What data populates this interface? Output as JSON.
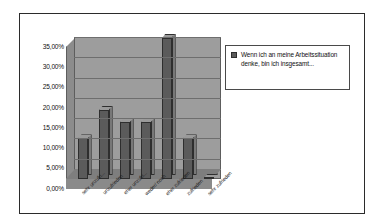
{
  "chart_data": {
    "type": "bar",
    "title": "",
    "xlabel": "",
    "ylabel": "",
    "ylim": [
      0,
      35
    ],
    "grid": true,
    "legend_position": "right",
    "categories": [
      "sehr unzufri...",
      "unzufrieden",
      "eher unzufri...",
      "weder/ noch",
      "eher zufrieden",
      "zufrieden",
      "sehr zufrieden"
    ],
    "values": [
      10.0,
      17.0,
      14.0,
      14.0,
      34.8,
      10.0,
      0.3
    ],
    "ytick_labels": [
      "0,00%",
      "5,00%",
      "10,00%",
      "15,00%",
      "20,00%",
      "25,00%",
      "30,00%",
      "35,00%"
    ],
    "ytick_values": [
      0,
      5,
      10,
      15,
      20,
      25,
      30,
      35
    ],
    "series": [
      {
        "name": "Wenn ich an meine Arbeitssituation denke, bin ich insgesamt...",
        "values": [
          10.0,
          17.0,
          14.0,
          14.0,
          34.8,
          10.0,
          0.3
        ],
        "color": "#5b5b5b"
      }
    ]
  },
  "legend": {
    "entries": [
      {
        "label": "Wenn ich an meine Arbeitssituation denke, bin ich insgesamt...",
        "color": "#5b5b5b"
      }
    ]
  },
  "colors": {
    "bar_front": "#5b5b5b",
    "bar_top": "#9a9a9a",
    "bar_side": "#787878",
    "plot_background": "#9d9d9d",
    "floor": "#8a8a8a",
    "border": "#2b2b2b"
  }
}
